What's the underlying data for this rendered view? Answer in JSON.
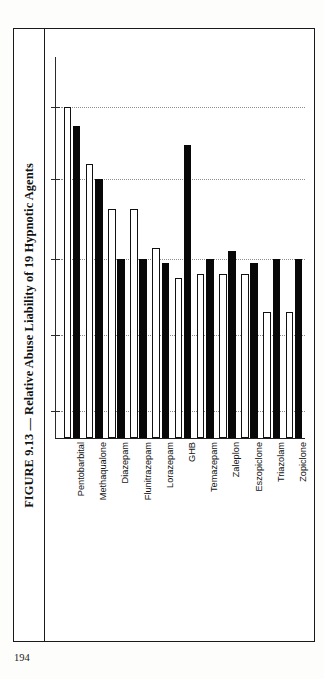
{
  "page": {
    "folio": "194"
  },
  "figure": {
    "title": "FIGURE 9.13 — Relative Abuse Liability of 19 Hypnotic Agents"
  },
  "chart_data": {
    "type": "bar",
    "title": "FIGURE 9.13 — Relative Abuse Liability of 19 Hypnotic Agents",
    "xlabel": "",
    "ylabel": "",
    "ylim": [
      0,
      100
    ],
    "grid": true,
    "grid_values": [
      87,
      68,
      47,
      27,
      7
    ],
    "legend": [],
    "axis_tick_labels_visible": false,
    "categories": [
      "Pentobarbital",
      "Methaqualone",
      "Diazepam",
      "Flunitrazepam",
      "Lorazepam",
      "GHB",
      "Temazepam",
      "Zaleplon",
      "Eszopiclone",
      "Triazolam",
      "Zopiclone"
    ],
    "series": [
      {
        "name": "white-bar",
        "fill": "#ffffff",
        "values": [
          87,
          72,
          60,
          60,
          50,
          42,
          43,
          43,
          43,
          33,
          33
        ]
      },
      {
        "name": "black-bar",
        "fill": "#080808",
        "values": [
          82,
          68,
          47,
          47,
          46,
          77,
          47,
          49,
          46,
          47,
          47
        ]
      }
    ]
  }
}
